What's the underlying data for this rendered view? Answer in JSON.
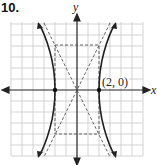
{
  "problem_number": "10.",
  "axes": {
    "x_label": "x",
    "y_label": "y"
  },
  "point_label": "(2, 0)",
  "vertices": [
    [
      -2,
      0
    ],
    [
      2,
      0
    ]
  ],
  "asymptotes": [
    "y = 2x",
    "y = -2x"
  ],
  "box": {
    "x": [
      -2,
      2
    ],
    "y": [
      -4,
      4
    ]
  },
  "colors": {
    "curve": "#222222",
    "grid": "#c8c8c8",
    "dash": "#555555",
    "axis": "#222222"
  }
}
